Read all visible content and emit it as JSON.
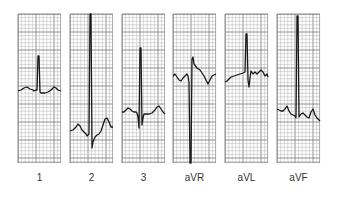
{
  "figure": {
    "grid": {
      "minor_color": "#b5b5b5",
      "major_color": "#7a7a7a",
      "border_color": "#8a8a8a",
      "trace_color": "#1a1a1a",
      "minor_step": 3.6,
      "major_every": 5
    },
    "leads": [
      {
        "label": "1",
        "x": 18,
        "points": "0,77 3,76 6,74 9,73 12,75 15,76 16,77 18,76 19,76 20,42 21,42 22,78 23,79 27,79 30,78 33,76 36,73 38,74 40,76 43,77"
      },
      {
        "label": "2",
        "x": 70,
        "points": "0,117 3,116 6,113 8,110 10,112 12,116 14,118 16,120 17,122 18,121 19,120 20,0 21,0 22,134 23,128 25,123 27,121 29,120 31,117 33,111 35,105 37,104 39,108 41,113 43,113"
      },
      {
        "label": "3",
        "x": 122,
        "points": "0,98 2,98 4,96 6,94 8,95 10,97 12,98 14,98 15,99 16,103 17,114 18,34 19,34 20,111 21,104 22,100 24,100 27,100 30,99 33,96 35,93 37,92 39,95 41,98 43,100"
      },
      {
        "label": "aVR",
        "x": 173,
        "points": "0,62 2,60 4,63 6,66 8,67 10,64 12,62 14,60 15,62 16,68 17,149 18,149 19,45 20,43 21,50 24,54 27,56 29,59 31,62 33,66 35,70 37,66 39,62 41,61 43,60"
      },
      {
        "label": "aVL",
        "x": 225,
        "points": "0,68 2,67 4,65 6,63 9,62 12,61 15,60 18,59 20,58 21,20 22,20 23,66 24,73 25,64 26,57 28,60 30,58 32,60 34,58 36,56 38,58 40,62 42,60 43,63"
      },
      {
        "label": "aVF",
        "x": 277,
        "points": "0,95 2,96 4,97 6,97 8,95 10,92 12,97 14,100 16,101 18,102 19,104 20,2 21,2 22,103 24,100 26,99 28,101 30,103 32,104 34,98 36,95 38,101 40,104 42,106 43,107"
      }
    ]
  }
}
